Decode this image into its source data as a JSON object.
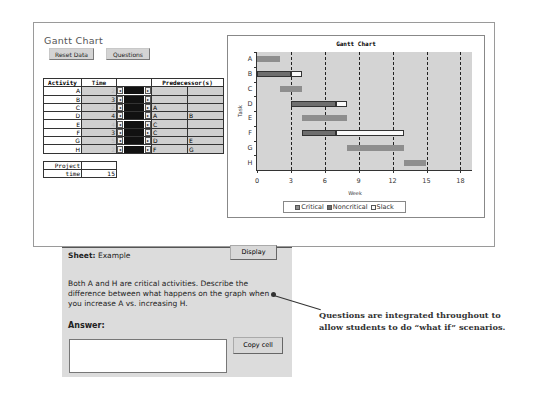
{
  "app": {
    "title": "Gantt Chart",
    "reset_button": "Reset Data",
    "questions_button": "Questions"
  },
  "table": {
    "headers": {
      "activity": "Activity",
      "time": "Time",
      "scroller": "",
      "predecessors": "Predecessor(s)"
    },
    "rows": [
      {
        "activity": "A",
        "time": "2",
        "pred1": "",
        "pred2": ""
      },
      {
        "activity": "B",
        "time": "3",
        "pred1": "",
        "pred2": ""
      },
      {
        "activity": "C",
        "time": "2",
        "pred1": "A",
        "pred2": ""
      },
      {
        "activity": "D",
        "time": "4",
        "pred1": "A",
        "pred2": "B"
      },
      {
        "activity": "E",
        "time": "4",
        "pred1": "C",
        "pred2": ""
      },
      {
        "activity": "F",
        "time": "3",
        "pred1": "C",
        "pred2": ""
      },
      {
        "activity": "G",
        "time": "5",
        "pred1": "D",
        "pred2": "E"
      },
      {
        "activity": "H",
        "time": "2",
        "pred1": "F",
        "pred2": "G"
      }
    ],
    "project_time_label_1": "Project",
    "project_time_label_2": "time",
    "project_time_value": "15"
  },
  "chart_data": {
    "type": "bar",
    "subtype": "gantt",
    "title": "Gantt Chart",
    "xlabel": "Week",
    "ylabel": "Task",
    "xlim": [
      0,
      19
    ],
    "xticks": [
      "0",
      "3",
      "6",
      "9",
      "12",
      "15",
      "18"
    ],
    "categories": [
      "A",
      "B",
      "C",
      "D",
      "E",
      "F",
      "G",
      "H"
    ],
    "grid": "vertical dashed at 3,6,9,12,15,18",
    "legend": [
      "Critical",
      "Noncritical",
      "Slack"
    ],
    "legend_position": "bottom",
    "tasks": [
      {
        "task": "A",
        "start": 0,
        "duration": 2,
        "type": "Critical",
        "slack": 0
      },
      {
        "task": "B",
        "start": 0,
        "duration": 3,
        "type": "Noncritical",
        "slack": 1
      },
      {
        "task": "C",
        "start": 2,
        "duration": 2,
        "type": "Critical",
        "slack": 0
      },
      {
        "task": "D",
        "start": 3,
        "duration": 4,
        "type": "Noncritical",
        "slack": 1
      },
      {
        "task": "E",
        "start": 4,
        "duration": 4,
        "type": "Critical",
        "slack": 0
      },
      {
        "task": "F",
        "start": 4,
        "duration": 3,
        "type": "Noncritical",
        "slack": 6
      },
      {
        "task": "G",
        "start": 8,
        "duration": 5,
        "type": "Critical",
        "slack": 0
      },
      {
        "task": "H",
        "start": 13,
        "duration": 2,
        "type": "Critical",
        "slack": 0
      }
    ],
    "colors": {
      "critical": "#8e8e8e",
      "noncritical": "#6e6e6e",
      "slack": "#fafafa",
      "plot_bg": "#d4d4d4"
    }
  },
  "sheet": {
    "label": "Sheet:",
    "name": "Example",
    "display_button": "Display",
    "question": "Both A and H are critical activities. Describe the difference between what happens on the graph when you increase A vs. increasing H.",
    "answer_label": "Answer:",
    "answer_value": "",
    "copy_button": "Copy cell"
  },
  "callout": {
    "text": "Questions are integrated throughout to allow students to do “what if” scenarios."
  }
}
